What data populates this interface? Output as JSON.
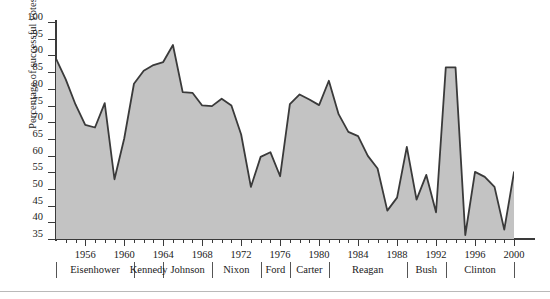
{
  "axes": {
    "ylabel": "Percentage of successful votes",
    "yticks": [
      35,
      40,
      45,
      50,
      55,
      60,
      65,
      70,
      75,
      80,
      85,
      90,
      95,
      100
    ],
    "xticklabels": [
      "1956",
      "1960",
      "1964",
      "1968",
      "1972",
      "1976",
      "1980",
      "1984",
      "1988",
      "1992",
      "1996",
      "2000"
    ]
  },
  "presidents": [
    {
      "name": "Eisenhower",
      "start": 1953,
      "end": 1961
    },
    {
      "name": "Kennedy",
      "start": 1961,
      "end": 1964
    },
    {
      "name": "Johnson",
      "start": 1964,
      "end": 1969
    },
    {
      "name": "Nixon",
      "start": 1969,
      "end": 1974
    },
    {
      "name": "Ford",
      "start": 1974,
      "end": 1977
    },
    {
      "name": "Carter",
      "start": 1977,
      "end": 1981
    },
    {
      "name": "Reagan",
      "start": 1981,
      "end": 1989
    },
    {
      "name": "Bush",
      "start": 1989,
      "end": 1993
    },
    {
      "name": "Clinton",
      "start": 1993,
      "end": 2001
    }
  ],
  "colors": {
    "area_fill": "#c3c3c3",
    "line": "#3a3a3a",
    "axis": "#3a3a3a",
    "text": "#1a1a1a",
    "rule": "#b9b9b9"
  },
  "chart_data": {
    "type": "area",
    "title": "",
    "xlabel": "",
    "ylabel": "Percentage of successful votes",
    "xlim": [
      1953,
      2000
    ],
    "ylim": [
      35,
      100
    ],
    "grid": false,
    "legend": "none",
    "x": [
      1953,
      1954,
      1955,
      1956,
      1957,
      1958,
      1959,
      1960,
      1961,
      1962,
      1963,
      1964,
      1965,
      1966,
      1967,
      1968,
      1969,
      1970,
      1971,
      1972,
      1973,
      1974,
      1975,
      1976,
      1977,
      1978,
      1979,
      1980,
      1981,
      1982,
      1983,
      1984,
      1985,
      1986,
      1987,
      1988,
      1989,
      1990,
      1991,
      1992,
      1993,
      1994,
      1995,
      1996,
      1997,
      1998,
      1999,
      2000
    ],
    "values": [
      89.0,
      82.8,
      75.3,
      69.2,
      68.4,
      75.7,
      52.9,
      65.1,
      81.5,
      85.4,
      87.1,
      88.0,
      93.1,
      79.0,
      78.8,
      75.0,
      74.8,
      77.0,
      75.0,
      66.3,
      50.6,
      59.6,
      61.0,
      53.8,
      75.4,
      78.3,
      76.8,
      75.1,
      82.4,
      72.4,
      67.1,
      65.8,
      59.9,
      56.1,
      43.5,
      47.4,
      62.6,
      46.8,
      54.2,
      43.0,
      86.4,
      86.4,
      36.2,
      55.1,
      53.6,
      50.6,
      37.8,
      55.0
    ],
    "units": "percent"
  }
}
